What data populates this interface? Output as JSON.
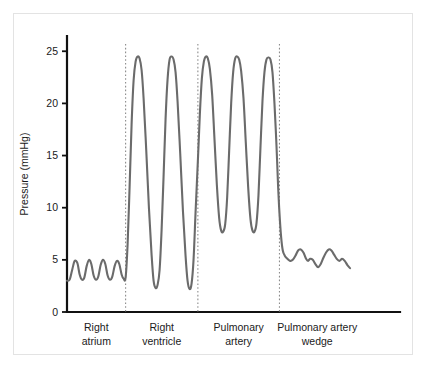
{
  "chart_data": {
    "type": "line",
    "title": "",
    "subtitle": "",
    "xlabel": "",
    "ylabel": "Pressure (mmHg)",
    "ylim": [
      0,
      27
    ],
    "xlim": [
      0,
      100
    ],
    "grid": false,
    "legend": null,
    "yticks": [
      0,
      5,
      10,
      15,
      20,
      25
    ],
    "ytick_labels": [
      "0",
      "5",
      "10",
      "15",
      "20",
      "25"
    ],
    "xtick_labels": [],
    "line_color": "#6b6b6b",
    "axis_color": "#111111",
    "divider_color": "#8c8c8c",
    "background_color": "#ffffff",
    "frame_color": "#e3e3e3",
    "section_labels": [
      {
        "line1": "Right",
        "line2": "atrium"
      },
      {
        "line1": "Right",
        "line2": "ventricle"
      },
      {
        "line1": "Pulmonary",
        "line2": "artery"
      },
      {
        "line1": "Pulmonary artery",
        "line2": "wedge"
      }
    ],
    "section_boundaries_x": [
      17.6,
      39.3,
      63.8
    ],
    "segments": [
      {
        "name": "Right atrium",
        "systolic": 5,
        "diastolic": 3,
        "mean": 4,
        "cycles": 4,
        "points": [
          [
            0.0,
            3.0
          ],
          [
            0.8,
            3.1
          ],
          [
            1.6,
            4.1
          ],
          [
            2.3,
            4.9
          ],
          [
            3.1,
            4.7
          ],
          [
            3.8,
            3.6
          ],
          [
            4.5,
            3.1
          ],
          [
            5.2,
            3.3
          ],
          [
            5.9,
            4.4
          ],
          [
            6.6,
            5.0
          ],
          [
            7.3,
            4.6
          ],
          [
            8.0,
            3.5
          ],
          [
            8.7,
            3.1
          ],
          [
            9.4,
            3.4
          ],
          [
            10.1,
            4.5
          ],
          [
            10.8,
            5.0
          ],
          [
            11.5,
            4.6
          ],
          [
            12.2,
            3.5
          ],
          [
            12.9,
            3.1
          ],
          [
            13.6,
            3.4
          ],
          [
            14.3,
            4.4
          ],
          [
            15.0,
            4.9
          ],
          [
            15.7,
            4.6
          ],
          [
            16.4,
            3.6
          ],
          [
            17.0,
            3.2
          ],
          [
            17.6,
            3.3
          ]
        ]
      },
      {
        "name": "Right ventricle",
        "systolic": 24.5,
        "diastolic": 2.3,
        "cycles": 2,
        "points": [
          [
            17.6,
            3.3
          ],
          [
            18.2,
            6.5
          ],
          [
            18.8,
            12.0
          ],
          [
            19.4,
            18.0
          ],
          [
            20.0,
            22.2
          ],
          [
            20.6,
            24.0
          ],
          [
            21.2,
            24.5
          ],
          [
            21.8,
            24.3
          ],
          [
            22.4,
            23.2
          ],
          [
            23.0,
            20.5
          ],
          [
            23.8,
            15.5
          ],
          [
            24.6,
            10.0
          ],
          [
            25.4,
            5.5
          ],
          [
            26.0,
            3.0
          ],
          [
            26.6,
            2.3
          ],
          [
            27.2,
            2.6
          ],
          [
            27.8,
            4.0
          ],
          [
            28.4,
            7.8
          ],
          [
            29.0,
            13.0
          ],
          [
            29.6,
            18.5
          ],
          [
            30.2,
            22.3
          ],
          [
            30.8,
            24.2
          ],
          [
            31.4,
            24.5
          ],
          [
            32.0,
            24.2
          ],
          [
            32.6,
            23.0
          ],
          [
            33.2,
            20.2
          ],
          [
            34.0,
            15.2
          ],
          [
            34.8,
            9.8
          ],
          [
            35.6,
            5.4
          ],
          [
            36.2,
            3.0
          ],
          [
            36.8,
            2.2
          ],
          [
            37.4,
            2.7
          ],
          [
            38.0,
            5.0
          ],
          [
            38.6,
            9.5
          ],
          [
            39.3,
            14.5
          ]
        ]
      },
      {
        "name": "Pulmonary artery",
        "systolic": 24.5,
        "diastolic": 7.7,
        "cycles": 3,
        "points": [
          [
            39.3,
            14.5
          ],
          [
            39.9,
            19.0
          ],
          [
            40.5,
            22.4
          ],
          [
            41.1,
            24.0
          ],
          [
            41.7,
            24.5
          ],
          [
            42.3,
            24.3
          ],
          [
            42.9,
            23.3
          ],
          [
            43.6,
            20.8
          ],
          [
            44.3,
            16.5
          ],
          [
            45.0,
            12.2
          ],
          [
            45.7,
            9.0
          ],
          [
            46.3,
            7.8
          ],
          [
            46.9,
            7.7
          ],
          [
            47.5,
            8.4
          ],
          [
            48.1,
            11.0
          ],
          [
            48.7,
            15.5
          ],
          [
            49.3,
            20.0
          ],
          [
            49.9,
            23.0
          ],
          [
            50.5,
            24.3
          ],
          [
            51.1,
            24.5
          ],
          [
            51.7,
            24.2
          ],
          [
            52.3,
            23.1
          ],
          [
            53.0,
            20.5
          ],
          [
            53.7,
            16.2
          ],
          [
            54.4,
            12.0
          ],
          [
            55.1,
            8.9
          ],
          [
            55.7,
            7.8
          ],
          [
            56.3,
            7.7
          ],
          [
            56.9,
            8.5
          ],
          [
            57.5,
            11.2
          ],
          [
            58.1,
            15.8
          ],
          [
            58.7,
            20.2
          ],
          [
            59.3,
            23.0
          ],
          [
            59.9,
            24.2
          ],
          [
            60.5,
            24.4
          ],
          [
            61.1,
            24.2
          ],
          [
            61.7,
            23.0
          ],
          [
            62.3,
            20.0
          ],
          [
            62.9,
            16.0
          ],
          [
            63.4,
            12.0
          ],
          [
            63.8,
            9.5
          ]
        ]
      },
      {
        "name": "Pulmonary artery wedge",
        "systolic": 6,
        "diastolic": 4,
        "mean": 5,
        "points": [
          [
            63.8,
            9.5
          ],
          [
            64.3,
            7.2
          ],
          [
            64.8,
            5.9
          ],
          [
            65.4,
            5.4
          ],
          [
            66.2,
            5.1
          ],
          [
            67.0,
            4.9
          ],
          [
            67.8,
            5.0
          ],
          [
            68.6,
            5.4
          ],
          [
            69.4,
            5.9
          ],
          [
            70.2,
            6.0
          ],
          [
            71.0,
            5.7
          ],
          [
            71.8,
            5.1
          ],
          [
            72.4,
            4.9
          ],
          [
            73.0,
            5.1
          ],
          [
            73.8,
            5.0
          ],
          [
            74.6,
            4.6
          ],
          [
            75.4,
            4.3
          ],
          [
            76.2,
            4.6
          ],
          [
            77.0,
            5.2
          ],
          [
            77.8,
            5.7
          ],
          [
            78.6,
            6.0
          ],
          [
            79.4,
            5.9
          ],
          [
            80.2,
            5.5
          ],
          [
            81.0,
            5.1
          ],
          [
            81.8,
            4.9
          ],
          [
            82.6,
            5.1
          ],
          [
            83.4,
            4.9
          ],
          [
            84.2,
            4.5
          ],
          [
            85.0,
            4.2
          ]
        ]
      }
    ]
  }
}
